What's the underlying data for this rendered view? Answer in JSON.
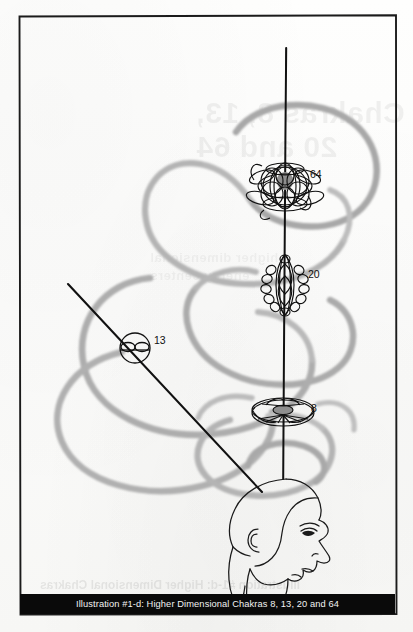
{
  "page": {
    "type": "scanned-book-illustration",
    "background_color": "#fdfdfc",
    "frame_color": "#1b1b1b"
  },
  "caption": {
    "text": "Illustration #1-d: Higher Dimensional Chakras 8, 13, 20 and 64",
    "band_color": "#0a0a0a",
    "text_color": "#f2f2f2"
  },
  "bleed_through": {
    "note": "faint mirrored text showing through from the reverse side of the page",
    "line_1": "Chakras 8, 13,",
    "line_2": "20 and 64",
    "line_3": "higher dimensional",
    "line_4": "energy centers",
    "caption_echo": "Illustration #1-d: Higher Dimensional Chakras"
  },
  "illustration": {
    "title": "Higher Dimensional Chakras",
    "subject": "human head in profile facing right with chakra energy axes",
    "axes": [
      {
        "name": "vertical-axis",
        "description": "vertical black axis line rising from crown of head",
        "color": "#111111",
        "from": [
          286,
          48
        ],
        "to": [
          283,
          479
        ]
      },
      {
        "name": "diagonal-axis",
        "description": "diagonal black axis line from upper left down to head temple",
        "color": "#111111",
        "from": [
          68,
          284
        ],
        "to": [
          262,
          492
        ]
      }
    ],
    "chakras": [
      {
        "id": "chakra-64",
        "label": "64",
        "glyph": "dense-overlapping-ellipse-cluster",
        "axis": "vertical-axis",
        "center": [
          285,
          186
        ],
        "label_position": [
          310,
          174
        ]
      },
      {
        "id": "chakra-20",
        "label": "20",
        "glyph": "vertical-lens-with-petals",
        "axis": "vertical-axis",
        "center": [
          285,
          285
        ],
        "label_position": [
          308,
          274
        ]
      },
      {
        "id": "chakra-8",
        "label": "8",
        "glyph": "flat-spoked-disc",
        "axis": "vertical-axis",
        "center": [
          283,
          413
        ],
        "label_position": [
          310,
          409
        ]
      },
      {
        "id": "chakra-13",
        "label": "13",
        "glyph": "circle-with-horizontal-lens",
        "axis": "diagonal-axis",
        "center": [
          135,
          348
        ],
        "label_position": [
          154,
          340
        ]
      }
    ],
    "spiral": {
      "name": "background-energy-spiral",
      "description": "large soft gray helical spiral loops winding through the figure",
      "color": "#b3b3b3",
      "loop_count": 6
    },
    "head": {
      "name": "human-head-profile",
      "facing": "right",
      "features": [
        "hair",
        "ear",
        "eye",
        "nose",
        "lips",
        "chin",
        "neck"
      ],
      "line_color": "#1a1a1a"
    }
  }
}
